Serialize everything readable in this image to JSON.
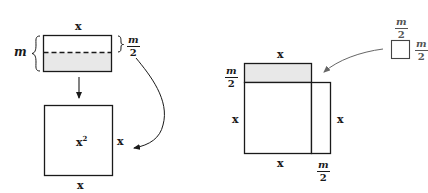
{
  "left_figure": {
    "rectangle": {
      "top_label": "x",
      "left_brace_label": "m",
      "right_brace_label": {
        "numerator": "m",
        "denominator": "2"
      },
      "shaded_half": "bottom",
      "divider": "dashed"
    },
    "square": {
      "center_label": "x",
      "center_exponent": "2",
      "right_label": "x",
      "bottom_label": "x"
    },
    "arrows": [
      "rectangle-to-square-down",
      "half-strip-to-square-side-curved"
    ]
  },
  "right_figure": {
    "shaded_strip": {
      "top_label": "x",
      "left_label": {
        "numerator": "m",
        "denominator": "2"
      }
    },
    "main_square": {
      "left_label": "x",
      "bottom_label": "x"
    },
    "side_strip": {
      "right_label": "x",
      "bottom_label": {
        "numerator": "m",
        "denominator": "2"
      }
    },
    "small_square": {
      "top_label": {
        "numerator": "m",
        "denominator": "2"
      },
      "right_label": {
        "numerator": "m",
        "denominator": "2"
      }
    },
    "arrows": [
      "small-square-to-corner-curved"
    ]
  },
  "colors": {
    "line": "#1a1a1a",
    "shade": "#e8e8e8",
    "arrow_gray": "#666666"
  }
}
